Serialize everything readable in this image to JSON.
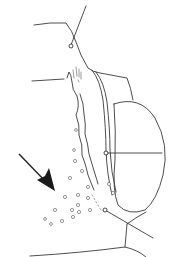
{
  "figure": {
    "colors": {
      "background": "#ffffff",
      "line": "#3a3a3a",
      "arrow": "#1a1a1a"
    },
    "pores": [
      [
        75,
        161
      ],
      [
        82,
        171
      ],
      [
        70,
        178
      ],
      [
        88,
        187
      ],
      [
        78,
        195
      ],
      [
        65,
        197
      ],
      [
        78,
        205
      ],
      [
        88,
        198
      ],
      [
        109,
        184
      ],
      [
        113,
        193
      ],
      [
        72,
        210
      ],
      [
        55,
        210
      ],
      [
        62,
        221
      ],
      [
        73,
        217
      ],
      [
        79,
        212
      ],
      [
        90,
        210
      ],
      [
        51,
        224
      ],
      [
        45,
        219
      ],
      [
        74,
        150
      ],
      [
        76,
        130
      ]
    ]
  }
}
